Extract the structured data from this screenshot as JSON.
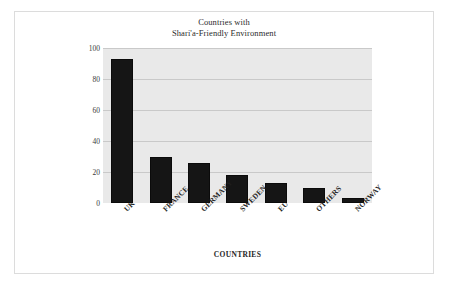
{
  "chart_data": {
    "type": "bar",
    "title": "Countries with Shari'a-Friendly Environment",
    "title_lines": [
      "Countries with",
      "Shari'a-Friendly Environment"
    ],
    "categories": [
      "UK",
      "FRANCE",
      "GERMANY",
      "SWEDEN",
      "EU",
      "OTHERS",
      "NORWAY"
    ],
    "values": [
      93,
      30,
      26,
      18,
      13,
      10,
      3
    ],
    "xlabel": "COUNTRIES",
    "ylabel": "% RESPONDENTS AGREEING",
    "ylim": [
      0,
      100
    ],
    "yticks": [
      0,
      20,
      40,
      60,
      80,
      100
    ],
    "ytick_labels": [
      "0",
      "20",
      "40",
      "60",
      "80",
      "100"
    ],
    "grid": true,
    "legend": false,
    "bar_color": "#151515",
    "plot_background": "#e9e9e9",
    "gridline_color": "#c9c9c9",
    "figure_background": "#ffffff"
  }
}
